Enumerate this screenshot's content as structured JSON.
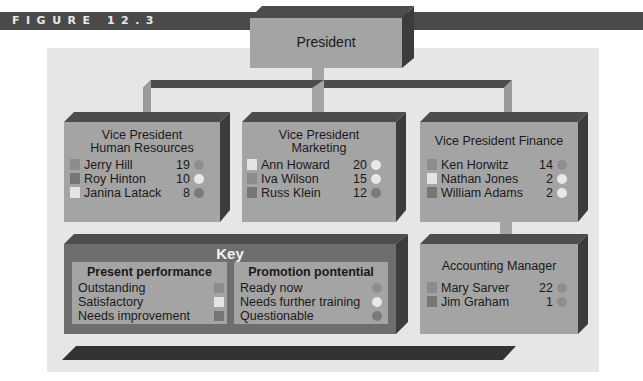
{
  "figure": {
    "label": "FIGURE 12.3"
  },
  "colors": {
    "page_bg": "#ffffff",
    "panel_bg": "#e6e6e6",
    "box_front": "#a4a4a4",
    "box_top": "#4d4d4d",
    "box_side": "#3c3c3c",
    "outstanding": "#8c8c8c",
    "satisfactory": "#e4e4e4",
    "needs_improvement": "#767676",
    "ready_now": "#8e8e8e",
    "needs_further_training": "#e8e8e8",
    "questionable": "#7a7a7a"
  },
  "president": {
    "title": "President"
  },
  "vp_hr": {
    "title_line1": "Vice President",
    "title_line2": "Human Resources",
    "employees": [
      {
        "name": "Jerry Hill",
        "years": "19",
        "performance": "outstanding",
        "promotion": "ready_now"
      },
      {
        "name": "Roy Hinton",
        "years": "10",
        "performance": "needs_improvement",
        "promotion": "needs_further_training"
      },
      {
        "name": "Janina Latack",
        "years": "8",
        "performance": "satisfactory",
        "promotion": "questionable"
      }
    ]
  },
  "vp_marketing": {
    "title_line1": "Vice President",
    "title_line2": "Marketing",
    "employees": [
      {
        "name": "Ann Howard",
        "years": "20",
        "performance": "satisfactory",
        "promotion": "needs_further_training"
      },
      {
        "name": "Iva Wilson",
        "years": "15",
        "performance": "outstanding",
        "promotion": "needs_further_training"
      },
      {
        "name": "Russ Klein",
        "years": "12",
        "performance": "needs_improvement",
        "promotion": "questionable"
      }
    ]
  },
  "vp_finance": {
    "title": "Vice President Finance",
    "employees": [
      {
        "name": "Ken Horwitz",
        "years": "14",
        "performance": "outstanding",
        "promotion": "ready_now"
      },
      {
        "name": "Nathan Jones",
        "years": "2",
        "performance": "satisfactory",
        "promotion": "needs_further_training"
      },
      {
        "name": "William Adams",
        "years": "2",
        "performance": "needs_improvement",
        "promotion": "needs_further_training"
      }
    ]
  },
  "accounting_manager": {
    "title": "Accounting Manager",
    "employees": [
      {
        "name": "Mary Sarver",
        "years": "22",
        "performance": "outstanding",
        "promotion": "ready_now"
      },
      {
        "name": "Jim Graham",
        "years": "1",
        "performance": "needs_improvement",
        "promotion": "ready_now"
      }
    ]
  },
  "key": {
    "title": "Key",
    "performance": {
      "heading": "Present performance",
      "items": [
        {
          "label": "Outstanding",
          "swatch": "outstanding"
        },
        {
          "label": "Satisfactory",
          "swatch": "satisfactory"
        },
        {
          "label": "Needs improvement",
          "swatch": "needs_improvement"
        }
      ]
    },
    "promotion": {
      "heading": "Promotion pontential",
      "items": [
        {
          "label": "Ready now",
          "swatch": "ready_now"
        },
        {
          "label": "Needs further training",
          "swatch": "needs_further_training"
        },
        {
          "label": "Questionable",
          "swatch": "questionable"
        }
      ]
    }
  }
}
